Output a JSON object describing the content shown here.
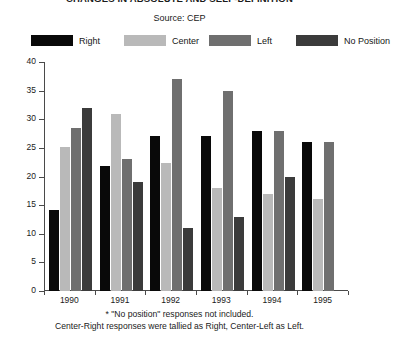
{
  "chart_data": {
    "type": "bar",
    "title": "CHANGES IN ABSOLUTE AND SELF-DEFINITION",
    "subtitle": "Source: CEP",
    "xlabel": "",
    "ylabel": "",
    "ylim": [
      0,
      40
    ],
    "yticks": [
      0,
      5,
      10,
      15,
      20,
      25,
      30,
      35,
      40
    ],
    "ytick_labels": [
      "0",
      "5",
      "10",
      "15",
      "20",
      "25",
      "30",
      "35",
      "40"
    ],
    "grid": false,
    "legend_position": "top",
    "categories": [
      "1990",
      "1991",
      "1992",
      "1993",
      "1994",
      "1995"
    ],
    "series": [
      {
        "name": "Right",
        "color": "#090909",
        "values": [
          14.2,
          21.8,
          27.0,
          27.0,
          28.0,
          26.0
        ]
      },
      {
        "name": "Center",
        "color": "#b9b9b9",
        "values": [
          25.2,
          31.0,
          22.3,
          18.0,
          17.0,
          16.0
        ]
      },
      {
        "name": "Left",
        "color": "#6f6f6f",
        "values": [
          28.5,
          23.0,
          37.0,
          35.0,
          28.0,
          26.0
        ]
      },
      {
        "name": "No Position",
        "color": "#3b3b3b",
        "values": [
          32.0,
          19.0,
          11.0,
          13.0,
          20.0,
          null
        ]
      }
    ],
    "annotations": [
      "* \"No position\" responses not included.",
      "Center-Right responses were tallied as Right, Center-Left as Left."
    ]
  }
}
